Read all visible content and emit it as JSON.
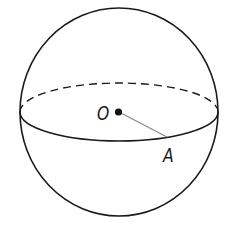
{
  "diagram": {
    "type": "sphere",
    "labels": {
      "center": "O",
      "surface_point": "A"
    },
    "colors": {
      "stroke": "#1a1a1a",
      "radius_line": "#888888",
      "background": "#ffffff"
    },
    "elements": [
      {
        "kind": "outline-circle",
        "description": "sphere silhouette"
      },
      {
        "kind": "equator-front",
        "style": "solid"
      },
      {
        "kind": "equator-back",
        "style": "dashed"
      },
      {
        "kind": "point",
        "label": "O",
        "description": "center of sphere"
      },
      {
        "kind": "segment",
        "from": "O",
        "to": "A",
        "description": "radius"
      },
      {
        "kind": "point",
        "label": "A",
        "description": "point on the equator"
      }
    ]
  }
}
